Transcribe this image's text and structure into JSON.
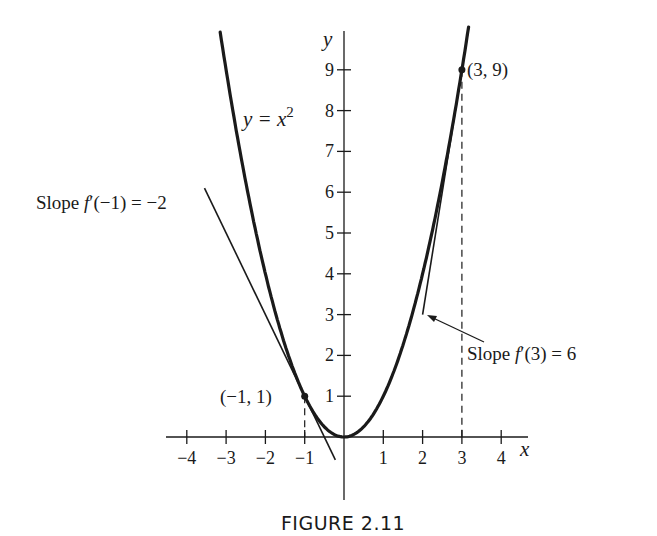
{
  "chart_data": {
    "type": "line",
    "title": "FIGURE 2.11",
    "xlabel": "x",
    "ylabel": "y",
    "xlim": [
      -4.5,
      4.6
    ],
    "ylim": [
      -1.5,
      10.2
    ],
    "grid": false,
    "legend": null,
    "x_ticks": [
      -4,
      -3,
      -2,
      -1,
      1,
      2,
      3,
      4
    ],
    "x_tick_labels": [
      "−4",
      "−3",
      "−2",
      "−1",
      "1",
      "2",
      "3",
      "4"
    ],
    "y_ticks": [
      1,
      2,
      3,
      4,
      5,
      6,
      7,
      8,
      9
    ],
    "y_tick_labels": [
      "1",
      "2",
      "3",
      "4",
      "5",
      "6",
      "7",
      "8",
      "9"
    ],
    "series": [
      {
        "name": "y = x^2",
        "kind": "curve",
        "function": "x^2",
        "x_range": [
          -3.15,
          3.17
        ],
        "label": "y = x²"
      },
      {
        "name": "tangent at x = -1",
        "kind": "line",
        "slope": -2,
        "point": [
          -1,
          1
        ],
        "x_range": [
          -3.55,
          -0.22
        ],
        "label": "Slope f′(−1) = −2"
      },
      {
        "name": "tangent at x = 3",
        "kind": "line",
        "slope": 6,
        "point": [
          3,
          9
        ],
        "x_range": [
          2.0,
          3.17
        ],
        "label": "Slope f′(3) = 6"
      }
    ],
    "points": [
      {
        "x": -1,
        "y": 1,
        "label": "(−1, 1)"
      },
      {
        "x": 3,
        "y": 9,
        "label": "(3, 9)"
      }
    ],
    "dashed_guides": [
      {
        "x": -1,
        "from_y": 1,
        "to_y": 0
      },
      {
        "x": 3,
        "from_y": 9,
        "to_y": 0
      }
    ]
  },
  "labels": {
    "curve": "y = x",
    "curve_exp": "2",
    "y_axis": "y",
    "x_axis": "x",
    "point_left": "(−1, 1)",
    "point_right": "(3, 9)",
    "slope_left_prefix": "Slope ",
    "slope_left_f": "f",
    "slope_left_rest": "′(−1) = −2",
    "slope_right_prefix": "Slope ",
    "slope_right_f": "f",
    "slope_right_rest": "′(3) = 6",
    "caption": "FIGURE 2.11"
  },
  "layout": {
    "origin_px": [
      344,
      437
    ],
    "unit_x_px": 39.3,
    "unit_y_px": 40.8,
    "x_axis_px": [
      166,
      528
    ],
    "y_axis_px": [
      31,
      500
    ],
    "ink": "#1a1a1a"
  }
}
